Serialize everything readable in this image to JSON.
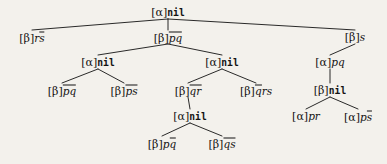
{
  "figure": {
    "type": "proof-tree",
    "title": "",
    "background_color": "#f3f1ec",
    "ink_color": "#131313"
  },
  "nodes": [
    {
      "id": "n0",
      "level": 1,
      "x": 168,
      "y": 12,
      "prefix": "[α]",
      "body": "nil",
      "kind": "nil",
      "text": "[α]nil"
    },
    {
      "id": "n1",
      "level": 2,
      "x": 32,
      "y": 37,
      "prefix": "[β]",
      "body": "rs̄",
      "kind": "literal",
      "text": "[β]rs̄"
    },
    {
      "id": "n2",
      "level": 2,
      "x": 168,
      "y": 37,
      "prefix": "[β]",
      "body": "p̄q̄",
      "kind": "literal",
      "text": "[β]p̄q̄"
    },
    {
      "id": "n3",
      "level": 2,
      "x": 355,
      "y": 37,
      "prefix": "[β]",
      "body": "s",
      "kind": "literal",
      "text": "[β]s"
    },
    {
      "id": "n4",
      "level": 3,
      "x": 98,
      "y": 62,
      "prefix": "[α]",
      "body": "nil",
      "kind": "nil",
      "text": "[α]nil"
    },
    {
      "id": "n5",
      "level": 3,
      "x": 222,
      "y": 62,
      "prefix": "[α]",
      "body": "nil",
      "kind": "nil",
      "text": "[α]nil"
    },
    {
      "id": "n6",
      "level": 3,
      "x": 330,
      "y": 62,
      "prefix": "[α]",
      "body": "pq",
      "kind": "literal",
      "text": "[α]pq"
    },
    {
      "id": "n7",
      "level": 4,
      "x": 62,
      "y": 90,
      "prefix": "[β]",
      "body": "p̄q̄",
      "kind": "literal",
      "text": "[β]p̄q̄"
    },
    {
      "id": "n8",
      "level": 4,
      "x": 124,
      "y": 90,
      "prefix": "[β]",
      "body": "p̄s̄",
      "kind": "literal",
      "text": "[β]p̄s̄"
    },
    {
      "id": "n9",
      "level": 4,
      "x": 188,
      "y": 90,
      "prefix": "[β]",
      "body": "q̄r̄",
      "kind": "literal",
      "text": "[β]q̄r̄"
    },
    {
      "id": "n10",
      "level": 4,
      "x": 256,
      "y": 90,
      "prefix": "[β]",
      "body": "q̄rs",
      "kind": "literal",
      "text": "[β]q̄rs"
    },
    {
      "id": "n11",
      "level": 4,
      "x": 330,
      "y": 90,
      "prefix": "[β]",
      "body": "nil",
      "kind": "nil",
      "text": "[β]nil"
    },
    {
      "id": "n12",
      "level": 5,
      "x": 190,
      "y": 116,
      "prefix": "[α]",
      "body": "nil",
      "kind": "nil",
      "text": "[α]nil"
    },
    {
      "id": "n13",
      "level": 5,
      "x": 306,
      "y": 116,
      "prefix": "[α]",
      "body": "pr",
      "kind": "literal",
      "text": "[α]pr"
    },
    {
      "id": "n14",
      "level": 5,
      "x": 358,
      "y": 116,
      "prefix": "[α]",
      "body": "ps̄",
      "kind": "literal",
      "text": "[α]ps̄"
    },
    {
      "id": "n15",
      "level": 6,
      "x": 162,
      "y": 143,
      "prefix": "[β]",
      "body": "pq̄",
      "kind": "literal",
      "text": "[β]pq̄"
    },
    {
      "id": "n16",
      "level": 6,
      "x": 222,
      "y": 143,
      "prefix": "[β]",
      "body": "q̄s̄",
      "kind": "literal",
      "text": "[β]q̄s̄"
    }
  ],
  "edges": [
    {
      "from": "n0",
      "to": "n1"
    },
    {
      "from": "n0",
      "to": "n2"
    },
    {
      "from": "n0",
      "to": "n3"
    },
    {
      "from": "n2",
      "to": "n4"
    },
    {
      "from": "n2",
      "to": "n5"
    },
    {
      "from": "n3",
      "to": "n6"
    },
    {
      "from": "n4",
      "to": "n7"
    },
    {
      "from": "n4",
      "to": "n8"
    },
    {
      "from": "n5",
      "to": "n9"
    },
    {
      "from": "n5",
      "to": "n10"
    },
    {
      "from": "n6",
      "to": "n11"
    },
    {
      "from": "n9",
      "to": "n12"
    },
    {
      "from": "n11",
      "to": "n13"
    },
    {
      "from": "n11",
      "to": "n14"
    },
    {
      "from": "n12",
      "to": "n15"
    },
    {
      "from": "n12",
      "to": "n16"
    }
  ]
}
